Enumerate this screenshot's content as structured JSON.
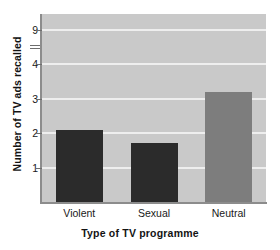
{
  "chart_data": {
    "type": "bar",
    "title": "",
    "xlabel": "Type of TV programme",
    "ylabel": "Number of TV ads recalled",
    "categories": [
      "Violent",
      "Sexual",
      "Neutral"
    ],
    "values": [
      2.1,
      1.7,
      3.2
    ],
    "series": [
      {
        "name": "Mean number of TV ads recalled",
        "values": [
          2.1,
          1.7,
          3.2
        ]
      }
    ],
    "ytick_labels": [
      "1",
      "2",
      "3",
      "4",
      "9"
    ],
    "ytick_values": [
      1,
      2,
      3,
      4,
      5
    ],
    "ylim": [
      0,
      5.45
    ],
    "grid": "horizontal",
    "legend": "none",
    "bar_colors": [
      "#2b2b2b",
      "#2b2b2b",
      "#7d7d7d"
    ],
    "plot_background": "#c9c9c9",
    "gridline_color": "#eeeeee",
    "axis_color": "#8c8c8c",
    "figure_background": "#ffffff",
    "annotations": [
      {
        "name": "y-axis-break-marks",
        "description": "double tick smudge between the 4 and 9 tick labels"
      }
    ]
  }
}
